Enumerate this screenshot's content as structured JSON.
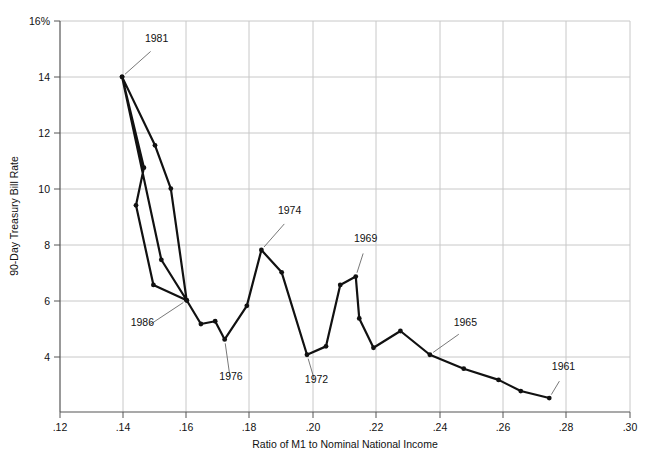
{
  "chart_data": {
    "type": "line",
    "title": "",
    "xlabel": "Ratio of M1 to Nominal National Income",
    "ylabel": "90-Day Treasury Bill Rate",
    "xlim": [
      0.12,
      0.3
    ],
    "ylim": [
      2.0,
      16.0
    ],
    "xticks": [
      0.12,
      0.14,
      0.16,
      0.18,
      0.2,
      0.22,
      0.24,
      0.26,
      0.28,
      0.3
    ],
    "xtick_labels": [
      ".12",
      ".14",
      ".16",
      ".18",
      ".20",
      ".22",
      ".24",
      ".26",
      ".28",
      ".30"
    ],
    "yticks": [
      4,
      6,
      8,
      10,
      12,
      14,
      16
    ],
    "ytick_labels": [
      "4",
      "6",
      "8",
      "10",
      "12",
      "14",
      "16%"
    ],
    "grid": "both",
    "legend": "none",
    "series": [
      {
        "name": "M1 ratio vs 90-Day Treasury Bill Rate",
        "marker": "filled-circle",
        "color": "#111111",
        "points": [
          {
            "year": "1961",
            "x": 0.2745,
            "y": 2.5
          },
          {
            "year": "1962",
            "x": 0.2655,
            "y": 2.75
          },
          {
            "year": "1963",
            "x": 0.2585,
            "y": 3.15
          },
          {
            "year": "1964",
            "x": 0.2475,
            "y": 3.55
          },
          {
            "year": "1965",
            "x": 0.2368,
            "y": 4.05
          },
          {
            "year": "1966",
            "x": 0.2275,
            "y": 4.9
          },
          {
            "year": "1967",
            "x": 0.219,
            "y": 4.3
          },
          {
            "year": "1968",
            "x": 0.2145,
            "y": 5.35
          },
          {
            "year": "1969",
            "x": 0.2134,
            "y": 6.85
          },
          {
            "year": "1970",
            "x": 0.2085,
            "y": 6.55
          },
          {
            "year": "1971",
            "x": 0.204,
            "y": 4.35
          },
          {
            "year": "1972",
            "x": 0.198,
            "y": 4.05
          },
          {
            "year": "1973",
            "x": 0.19,
            "y": 7.0
          },
          {
            "year": "1974",
            "x": 0.1836,
            "y": 7.8
          },
          {
            "year": "1975",
            "x": 0.179,
            "y": 5.8
          },
          {
            "year": "1976",
            "x": 0.172,
            "y": 4.6
          },
          {
            "year": "1977",
            "x": 0.169,
            "y": 5.25
          },
          {
            "year": "1978",
            "x": 0.1645,
            "y": 5.15
          },
          {
            "year": "1979",
            "x": 0.16,
            "y": 6.0
          },
          {
            "year": "1980",
            "x": 0.152,
            "y": 7.45
          },
          {
            "year": "1981",
            "x": 0.1396,
            "y": 14.0
          },
          {
            "year": "1982",
            "x": 0.15,
            "y": 11.55
          },
          {
            "year": "1983",
            "x": 0.155,
            "y": 10.0
          },
          {
            "year": "1984",
            "x": 0.16,
            "y": 6.0
          },
          {
            "year": "1985",
            "x": 0.1495,
            "y": 6.55
          },
          {
            "year": "1986",
            "x": 0.144,
            "y": 9.4
          },
          {
            "year": "1987",
            "x": 0.1465,
            "y": 10.75
          },
          {
            "year": "1988",
            "x": 0.1396,
            "y": 14.0
          }
        ]
      }
    ],
    "annotations": [
      {
        "text": "1981",
        "x": 0.1396,
        "y": 14.0,
        "label_x": 0.1505,
        "label_y": 15.1
      },
      {
        "text": "1986",
        "x": 0.16,
        "y": 6.0,
        "label_x": 0.146,
        "label_y": 4.95
      },
      {
        "text": "1976",
        "x": 0.172,
        "y": 4.6,
        "label_x": 0.174,
        "label_y": 3.0
      },
      {
        "text": "1974",
        "x": 0.1836,
        "y": 7.8,
        "label_x": 0.1925,
        "label_y": 8.95
      },
      {
        "text": "1972",
        "x": 0.198,
        "y": 4.05,
        "label_x": 0.201,
        "label_y": 2.9
      },
      {
        "text": "1969",
        "x": 0.2134,
        "y": 6.85,
        "label_x": 0.2165,
        "label_y": 7.95
      },
      {
        "text": "1965",
        "x": 0.2368,
        "y": 4.05,
        "label_x": 0.248,
        "label_y": 4.95
      },
      {
        "text": "1961",
        "x": 0.2745,
        "y": 2.5,
        "label_x": 0.279,
        "label_y": 3.35
      }
    ]
  },
  "axes": {
    "x_title": "Ratio of M1 to Nominal National Income",
    "y_title": "90-Day Treasury Bill Rate",
    "x_tick_0": ".12",
    "x_tick_1": ".14",
    "x_tick_2": ".16",
    "x_tick_3": ".18",
    "x_tick_4": ".20",
    "x_tick_5": ".22",
    "x_tick_6": ".24",
    "x_tick_7": ".26",
    "x_tick_8": ".28",
    "x_tick_9": ".30",
    "y_tick_0": "4",
    "y_tick_1": "6",
    "y_tick_2": "8",
    "y_tick_3": "10",
    "y_tick_4": "12",
    "y_tick_5": "14",
    "y_tick_6": "16%"
  },
  "labels": {
    "a_1981": "1981",
    "a_1986": "1986",
    "a_1976": "1976",
    "a_1974": "1974",
    "a_1972": "1972",
    "a_1969": "1969",
    "a_1965": "1965",
    "a_1961": "1961"
  },
  "colors": {
    "line": "#111111",
    "grid": "#c8c8c8",
    "axis": "#555555",
    "text": "#111111",
    "background": "#ffffff"
  }
}
